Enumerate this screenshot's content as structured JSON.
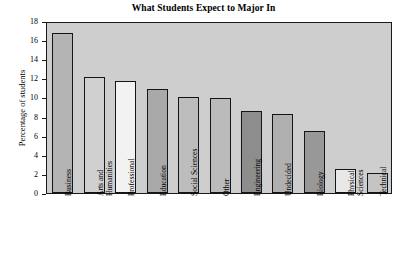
{
  "chart_data": {
    "type": "bar",
    "title": "What Students Expect to Major In",
    "xlabel": "",
    "ylabel": "Percentage of students",
    "ylim": [
      0,
      18
    ],
    "ytick_step": 2,
    "yticks": [
      18,
      16,
      14,
      12,
      10,
      8,
      6,
      4,
      2,
      0
    ],
    "grid": false,
    "legend": null,
    "plot_background": "#cecece",
    "frame_color": "#1a1a1a",
    "categories": [
      "Business",
      "Arts and Humanities",
      "Professional",
      "Education",
      "Social Sciences",
      "Other",
      "Engineering",
      "Undecided",
      "Biology",
      "Physical Sciences",
      "Technical"
    ],
    "category_lines": [
      [
        "Business"
      ],
      [
        "Arts and",
        "Humanities"
      ],
      [
        "Professional"
      ],
      [
        "Education"
      ],
      [
        "Social Sciences"
      ],
      [
        "Other"
      ],
      [
        "Engineering"
      ],
      [
        "Undecided"
      ],
      [
        "Biology"
      ],
      [
        "Physical",
        "Sciences"
      ],
      [
        "Technical"
      ]
    ],
    "values": [
      16.7,
      12.1,
      11.7,
      10.9,
      10.0,
      9.9,
      8.6,
      8.3,
      6.5,
      2.5,
      2.1
    ],
    "bar_colors": [
      "#b5b5b5",
      "#d2d2d2",
      "#f0f0f0",
      "#bdbdbd",
      "#b8b8b8",
      "#c2c2c2",
      "#8c8c8c",
      "#b3b3b3",
      "#8a8a8a",
      "#e9e9e9",
      "#c6c6c6",
      "#1c1c1c",
      "#9a9a9a"
    ],
    "bars": [
      {
        "label": "Business",
        "value": 16.7,
        "color": "#b4b4b4"
      },
      {
        "label": "Arts and Humanities",
        "value": 12.1,
        "color": "#d0d0d0"
      },
      {
        "label": "Professional",
        "value": 11.7,
        "color": "#f2f2f2"
      },
      {
        "label": "Education",
        "value": 10.9,
        "color": "#a9a9a9"
      },
      {
        "label": "Social Sciences",
        "value": 10.0,
        "color": "#bdbdbd"
      },
      {
        "label": "Other",
        "value": 9.9,
        "color": "#bbbbbb"
      },
      {
        "label": "Engineering",
        "value": 8.6,
        "color": "#8d8d8d"
      },
      {
        "label": "Undecided",
        "value": 8.3,
        "color": "#b0b0b0"
      },
      {
        "label": "Biology",
        "value": 6.5,
        "color": "#989898"
      },
      {
        "label": "Physical Sciences",
        "value": 2.5,
        "color": "#e8e8e8"
      },
      {
        "label": "Technical",
        "value": 2.1,
        "color": "#c4c4c4"
      }
    ]
  },
  "chart": {
    "title": "What Students Expect to Major In",
    "ylabel": "Percentage of students"
  }
}
